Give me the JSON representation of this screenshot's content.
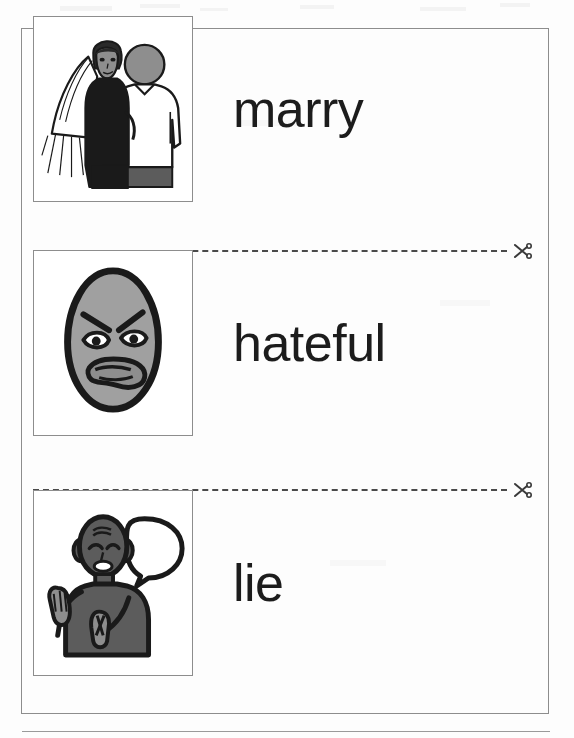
{
  "document": {
    "type": "vocabulary-flashcard-worksheet",
    "orientation": "portrait",
    "card_count": 3,
    "cut_line_count": 2
  },
  "colors": {
    "page_background": "#ffffff",
    "frame_border": "#8d8d8d",
    "text": "#1c1c1c",
    "cut_line": "#4a4a4a",
    "ink_black": "#1a1a1a",
    "skin_grey": "#8e8e8e",
    "face_grey": "#a0a0a0",
    "body_grey": "#5c5c5c",
    "hair_grey": "#7a7a7a",
    "garment_white": "#ffffff"
  },
  "cards": [
    {
      "id": "card-marry",
      "word": "marry",
      "icon_name": "wedding-couple-pictogram",
      "description": "Bride in black dress with white veil standing beside groom in white shirt"
    },
    {
      "id": "card-hateful",
      "word": "hateful",
      "icon_name": "angry-face-pictogram",
      "description": "Grey oval face with furrowed angry eyebrows and snarling mouth"
    },
    {
      "id": "card-lie",
      "word": "lie",
      "icon_name": "lying-person-pictogram",
      "description": "Person speaking with empty speech bubble, hand raised and fingers crossed"
    }
  ],
  "cut_lines": [
    {
      "id": "cut-line-1",
      "style": "dashed",
      "icon_name": "scissors-icon",
      "icon_position": "right"
    },
    {
      "id": "cut-line-2",
      "style": "dashed",
      "icon_name": "scissors-icon",
      "icon_position": "right"
    }
  ]
}
